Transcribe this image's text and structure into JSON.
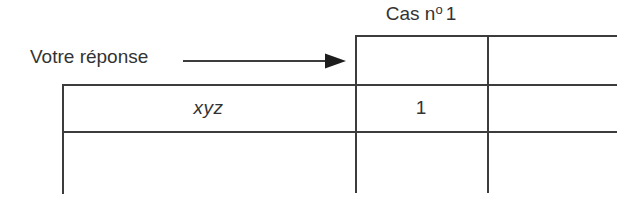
{
  "diagram": {
    "title_text": "Cas nº 1",
    "header": {
      "prefix": "Cas n",
      "ordinal": "o",
      "number": "1"
    },
    "annotation": {
      "label": "Votre réponse",
      "arrow_icon": "right-arrow-icon"
    },
    "table": {
      "row_label": "xyz",
      "case1_value": "1",
      "columns": [
        "Cas nº 1",
        ""
      ],
      "rows": [
        {
          "label": "",
          "values": [
            "",
            ""
          ]
        },
        {
          "label": "xyz",
          "values": [
            "1",
            ""
          ]
        },
        {
          "label": "",
          "values": [
            "",
            ""
          ]
        }
      ]
    },
    "colors": {
      "background": "#ffffff",
      "stroke": "#3c3c3c",
      "text": "#333333"
    }
  }
}
